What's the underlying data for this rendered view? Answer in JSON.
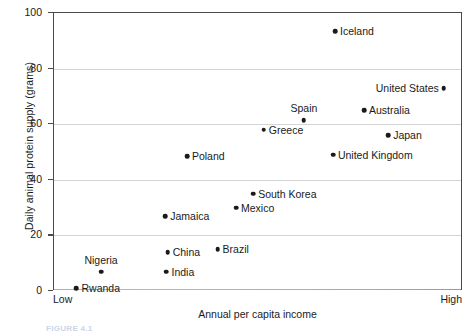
{
  "chart_data": {
    "type": "scatter",
    "title": "",
    "xlabel": "Annual per capita income",
    "ylabel": "Daily animal protein supply (grams)",
    "ylim": [
      0,
      100
    ],
    "yticks": [
      0,
      20,
      40,
      60,
      80,
      100
    ],
    "ytick_labels": [
      "0",
      "20",
      "40",
      "60",
      "80",
      "100"
    ],
    "x_axis_endpoints": {
      "low": "Low",
      "high": "High"
    },
    "grid": true,
    "legend": "none",
    "points": [
      {
        "label": "Rwanda",
        "x": 0.055,
        "y": 1,
        "label_pos": "right"
      },
      {
        "label": "Nigeria",
        "x": 0.115,
        "y": 7,
        "label_pos": "above"
      },
      {
        "label": "India",
        "x": 0.275,
        "y": 7,
        "label_pos": "right"
      },
      {
        "label": "China",
        "x": 0.278,
        "y": 14,
        "label_pos": "right"
      },
      {
        "label": "Brazil",
        "x": 0.4,
        "y": 15,
        "label_pos": "right"
      },
      {
        "label": "Jamaica",
        "x": 0.272,
        "y": 27,
        "label_pos": "right"
      },
      {
        "label": "Mexico",
        "x": 0.445,
        "y": 30,
        "label_pos": "right"
      },
      {
        "label": "South Korea",
        "x": 0.487,
        "y": 35,
        "label_pos": "right"
      },
      {
        "label": "Poland",
        "x": 0.325,
        "y": 48.5,
        "label_pos": "right"
      },
      {
        "label": "United Kingdom",
        "x": 0.682,
        "y": 49,
        "label_pos": "right"
      },
      {
        "label": "Greece",
        "x": 0.513,
        "y": 58,
        "label_pos": "right"
      },
      {
        "label": "Japan",
        "x": 0.817,
        "y": 56,
        "label_pos": "right"
      },
      {
        "label": "Spain",
        "x": 0.611,
        "y": 61.5,
        "label_pos": "above"
      },
      {
        "label": "Australia",
        "x": 0.758,
        "y": 65,
        "label_pos": "right"
      },
      {
        "label": "United States",
        "x": 0.953,
        "y": 73,
        "label_pos": "left"
      },
      {
        "label": "Iceland",
        "x": 0.687,
        "y": 93.5,
        "label_pos": "right"
      }
    ]
  },
  "caption": {
    "text": "FIGURE 4.1"
  }
}
